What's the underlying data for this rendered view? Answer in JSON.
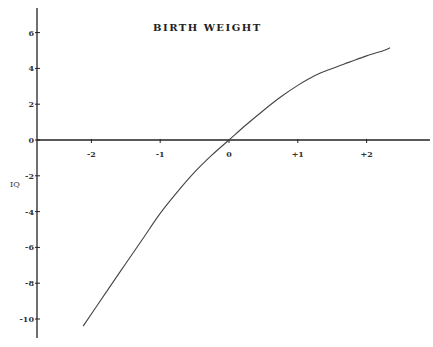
{
  "chart_data": {
    "type": "line",
    "title": "BIRTH WEIGHT",
    "xlabel": "",
    "ylabel": "IQ",
    "xlim": [
      -2.6,
      2.9
    ],
    "ylim": [
      -11,
      7
    ],
    "grid": false,
    "legend": null,
    "x_ticks": [
      -2,
      -1,
      0,
      1,
      2
    ],
    "x_tick_labels": [
      "-2",
      "-1",
      "0",
      "+1",
      "+2"
    ],
    "y_ticks": [
      6,
      4,
      2,
      0,
      -2,
      -4,
      -6,
      -8,
      -10
    ],
    "y_tick_labels": [
      "6",
      "4",
      "2",
      "0",
      "-2",
      "-4",
      "-6",
      "-8",
      "-10"
    ],
    "series": [
      {
        "name": "IQ vs birth weight",
        "x": [
          -2.12,
          -1.75,
          -1.5,
          -1.25,
          -1.0,
          -0.75,
          -0.5,
          -0.25,
          0.0,
          0.25,
          0.5,
          0.75,
          1.0,
          1.25,
          1.5,
          1.75,
          2.0,
          2.25,
          2.34
        ],
        "y": [
          -10.4,
          -8.3,
          -6.9,
          -5.5,
          -4.1,
          -2.9,
          -1.8,
          -0.85,
          0.0,
          0.85,
          1.65,
          2.4,
          3.05,
          3.6,
          4.0,
          4.35,
          4.7,
          5.0,
          5.15
        ]
      }
    ]
  }
}
